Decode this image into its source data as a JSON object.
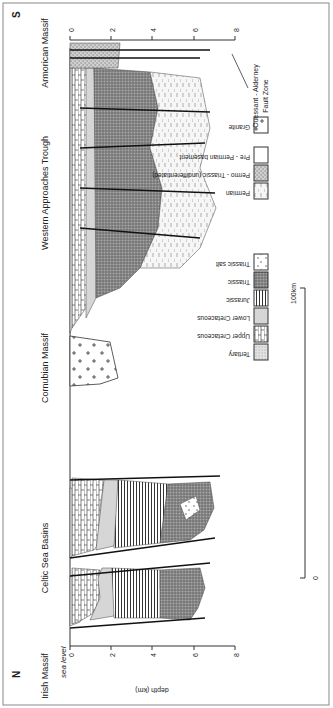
{
  "figure": {
    "orientation_note": "figure rotated 90 degrees counter-clockwise",
    "compass": {
      "north": "N",
      "south": "S"
    },
    "regions": [
      {
        "name": "Irish Massif"
      },
      {
        "name": "Celtic Sea Basins"
      },
      {
        "name": "Cornubian Massif"
      },
      {
        "name": "Western Approaches Trough"
      },
      {
        "name": "Armorican Massif"
      }
    ],
    "sea_level_label": "sea level",
    "depth_axis": {
      "label": "depth (km)",
      "ticks": [
        "0",
        "2",
        "4",
        "6",
        "8"
      ]
    },
    "right_depth_ticks": [
      "0",
      "2",
      "4",
      "6",
      "8"
    ],
    "fault_annotation": {
      "line1": "Ouessant - Alderney",
      "line2": "Fault Zone"
    },
    "scale_bar": {
      "start": "0",
      "end": "100km"
    },
    "legend": {
      "col1": [
        {
          "label": "Tertiary",
          "pattern": "fine-stipple"
        },
        {
          "label": "Upper Cretaceous",
          "pattern": "brick"
        },
        {
          "label": "Lower Cretaceous",
          "pattern": "light-grey"
        },
        {
          "label": "Jurassic",
          "pattern": "vertical-lines"
        },
        {
          "label": "Triassic",
          "pattern": "dark-stipple"
        },
        {
          "label": "Triassic salt",
          "pattern": "dots"
        }
      ],
      "col2": [
        {
          "label": "Permian",
          "pattern": "dashes"
        },
        {
          "label": "Permo - Triassic (undifferentiated)",
          "pattern": "coarse-stipple"
        },
        {
          "label": "Pre - Permian basement",
          "pattern": "blank"
        },
        {
          "label": "Granite",
          "pattern": "crosses"
        }
      ]
    }
  }
}
